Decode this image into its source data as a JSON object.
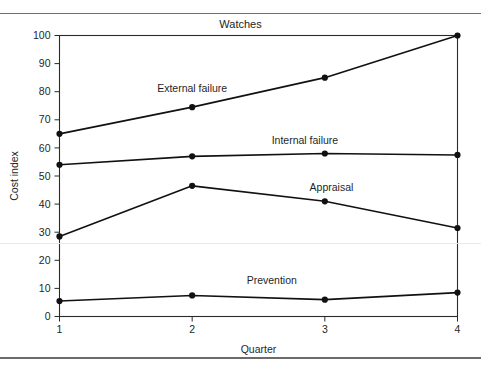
{
  "page": {
    "top_cutoff_text": "",
    "has_top_rule": true,
    "has_bottom_rule": true
  },
  "chart_data": {
    "type": "line",
    "title": "Watches",
    "xlabel": "Quarter",
    "ylabel": "Cost index",
    "categories": [
      "1",
      "2",
      "3",
      "4"
    ],
    "x": [
      1,
      2,
      3,
      4
    ],
    "xlim": [
      1,
      4
    ],
    "ylim": [
      0,
      100
    ],
    "ytick_labels": [
      "0",
      "10",
      "20",
      "30",
      "40",
      "50",
      "60",
      "70",
      "80",
      "90",
      "100"
    ],
    "yticks": [
      0,
      10,
      20,
      30,
      40,
      50,
      60,
      70,
      80,
      90,
      100
    ],
    "xtick_labels": [
      "1",
      "2",
      "3",
      "4"
    ],
    "grid": false,
    "legend": "inline-labels",
    "marker": "filled-circle",
    "line_color": "#111111",
    "series": [
      {
        "name": "External failure",
        "values": [
          65,
          74.5,
          85,
          100
        ],
        "label_x": 2,
        "label_y": 80
      },
      {
        "name": "Internal failure",
        "values": [
          54,
          57,
          58,
          57.5
        ],
        "label_x": 2.85,
        "label_y": 61.5
      },
      {
        "name": "Appraisal",
        "values": [
          28.5,
          46.5,
          41,
          31.5
        ],
        "label_x": 3.05,
        "label_y": 44.5
      },
      {
        "name": "Prevention",
        "values": [
          5.5,
          7.5,
          6,
          8.5
        ],
        "label_x": 2.6,
        "label_y": 11.5
      }
    ]
  }
}
